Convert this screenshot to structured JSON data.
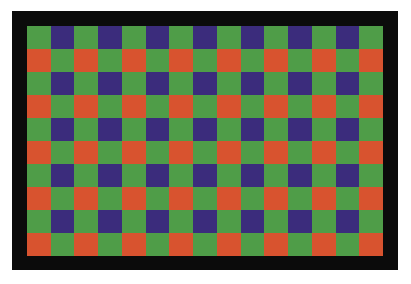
{
  "image": {
    "description": "Bayer color filter array pattern",
    "columns": 15,
    "rows": 10,
    "colors": {
      "G": "#4f9d48",
      "B": "#3b2c7c",
      "R": "#d8532f",
      "border": "#0b0b0b",
      "background": "#ffffff"
    },
    "row_patterns": {
      "even": [
        "G",
        "B"
      ],
      "odd": [
        "R",
        "G"
      ]
    }
  }
}
